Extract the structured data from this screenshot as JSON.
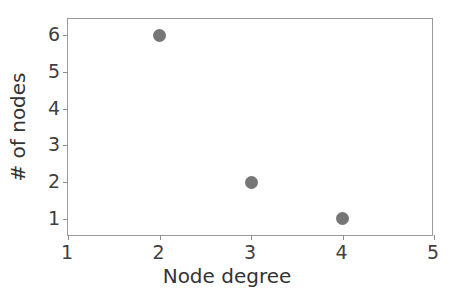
{
  "chart_data": {
    "type": "scatter",
    "title": "",
    "xlabel": "Node degree",
    "ylabel": "# of nodes",
    "x": [
      2,
      3,
      4
    ],
    "values": [
      6,
      2,
      1
    ],
    "points": [
      {
        "x": 2,
        "y": 6
      },
      {
        "x": 3,
        "y": 2
      },
      {
        "x": 4,
        "y": 1
      }
    ],
    "xlim": [
      1,
      5
    ],
    "ylim": [
      0.5,
      6.45
    ],
    "xticks": [
      "1",
      "2",
      "3",
      "4",
      "5"
    ],
    "yticks": [
      "1",
      "2",
      "3",
      "4",
      "5",
      "6"
    ],
    "xtick_values": [
      1,
      2,
      3,
      4,
      5
    ],
    "ytick_values": [
      1,
      2,
      3,
      4,
      5,
      6
    ],
    "grid": false,
    "legend": null,
    "marker": "circle",
    "marker_color": "#767676",
    "axis_color": "#9a9a9a",
    "text_color": "#343434"
  }
}
